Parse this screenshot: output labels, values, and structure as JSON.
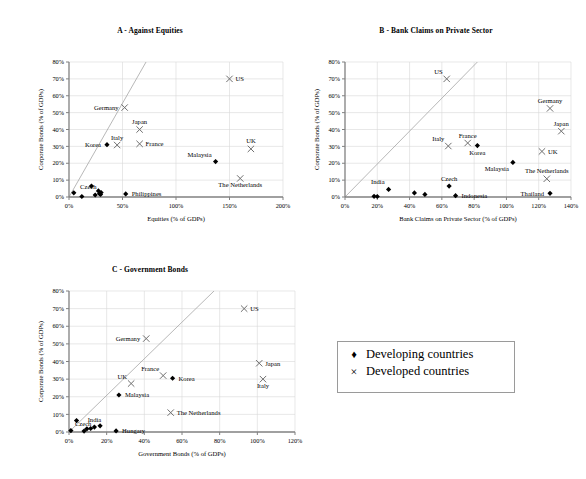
{
  "legend": {
    "items": [
      {
        "marker": "diamond",
        "marker_glyph": "♦",
        "label": "Developing countries"
      },
      {
        "marker": "cross",
        "marker_glyph": "×",
        "label": "Developed countries"
      }
    ]
  },
  "colors": {
    "marker": "#000000",
    "axis": "#808080",
    "gridline": "#d9d9d9",
    "refline": "#a6a6a6",
    "text": "#000000",
    "legend_border": "#9a9a9a"
  },
  "chart_data": [
    {
      "id": "panel-a",
      "type": "scatter",
      "title": "A - Against Equities",
      "xlabel": "Equities (% of GDPs)",
      "ylabel": "Corporate Bonds (% of GDPs)",
      "xlim": [
        0,
        200
      ],
      "ylim": [
        0,
        80
      ],
      "xticks": [
        0,
        50,
        100,
        150,
        200
      ],
      "yticks": [
        0,
        10,
        20,
        30,
        40,
        50,
        60,
        70,
        80
      ],
      "xticklabels": [
        "0%",
        "50%",
        "100%",
        "150%",
        "200%"
      ],
      "yticklabels": [
        "0%",
        "10%",
        "20%",
        "30%",
        "40%",
        "50%",
        "60%",
        "70%",
        "80%"
      ],
      "grid": true,
      "reference_line": {
        "from": [
          0,
          0
        ],
        "to": [
          72,
          82
        ],
        "style": "45-degree"
      },
      "series": [
        {
          "name": "Developing countries",
          "marker": "diamond",
          "points": [
            {
              "label": "",
              "x": 4.5,
              "y": 2.5,
              "label_pos": ""
            },
            {
              "label": "",
              "x": 12.0,
              "y": 0.3,
              "label_pos": ""
            },
            {
              "label": "",
              "x": 21.0,
              "y": 6.5,
              "label_pos": ""
            },
            {
              "label": "",
              "x": 24.5,
              "y": 1.2,
              "label_pos": ""
            },
            {
              "label": "",
              "x": 27.5,
              "y": 3.6,
              "label_pos": ""
            },
            {
              "label": "",
              "x": 28.5,
              "y": 2.0,
              "label_pos": ""
            },
            {
              "label": "",
              "x": 30.0,
              "y": 2.6,
              "label_pos": ""
            },
            {
              "label": "Czech",
              "x": 29.5,
              "y": 1.5,
              "label_pos": "above-left"
            },
            {
              "label": "Korea",
              "x": 35.5,
              "y": 31.0,
              "label_pos": "left"
            },
            {
              "label": "Philippines",
              "x": 53.0,
              "y": 1.8,
              "label_pos": "right"
            },
            {
              "label": "Malaysia",
              "x": 137.0,
              "y": 21.0,
              "label_pos": "above-left"
            }
          ]
        },
        {
          "name": "Developed countries",
          "marker": "cross",
          "points": [
            {
              "label": "Italy",
              "x": 45.0,
              "y": 30.8,
              "label_pos": "above"
            },
            {
              "label": "Germany",
              "x": 52.0,
              "y": 53.0,
              "label_pos": "left"
            },
            {
              "label": "Japan",
              "x": 66.0,
              "y": 40.0,
              "label_pos": "above"
            },
            {
              "label": "France",
              "x": 66.0,
              "y": 31.5,
              "label_pos": "right"
            },
            {
              "label": "US",
              "x": 150.0,
              "y": 70.0,
              "label_pos": "right"
            },
            {
              "label": "The Netherlands",
              "x": 160.0,
              "y": 11.0,
              "label_pos": "below"
            },
            {
              "label": "UK",
              "x": 170.0,
              "y": 28.5,
              "label_pos": "above"
            }
          ]
        }
      ]
    },
    {
      "id": "panel-b",
      "type": "scatter",
      "title": "B - Bank Claims on Private Sector",
      "xlabel": "Bank Claims on Private Sector (% of GDPs)",
      "ylabel": "Corporate Bonds (% of GDPs)",
      "xlim": [
        0,
        140
      ],
      "ylim": [
        0,
        80
      ],
      "xticks": [
        0,
        20,
        40,
        60,
        80,
        100,
        120,
        140
      ],
      "yticks": [
        0,
        10,
        20,
        30,
        40,
        50,
        60,
        70,
        80
      ],
      "xticklabels": [
        "0%",
        "20%",
        "40%",
        "60%",
        "80%",
        "100%",
        "120%",
        "140%"
      ],
      "yticklabels": [
        "0%",
        "10%",
        "20%",
        "30%",
        "40%",
        "50%",
        "60%",
        "70%",
        "80%"
      ],
      "grid": true,
      "reference_line": {
        "from": [
          0,
          0
        ],
        "to": [
          82,
          82
        ],
        "style": "45-degree"
      },
      "series": [
        {
          "name": "Developing countries",
          "marker": "diamond",
          "points": [
            {
              "label": "",
              "x": 18.0,
              "y": 0.4,
              "label_pos": ""
            },
            {
              "label": "",
              "x": 20.0,
              "y": 0.3,
              "label_pos": ""
            },
            {
              "label": "India",
              "x": 27.0,
              "y": 4.5,
              "label_pos": "above-left"
            },
            {
              "label": "",
              "x": 43.0,
              "y": 2.4,
              "label_pos": ""
            },
            {
              "label": "",
              "x": 49.5,
              "y": 1.5,
              "label_pos": ""
            },
            {
              "label": "Czech",
              "x": 64.5,
              "y": 6.5,
              "label_pos": "above"
            },
            {
              "label": "Indonesia",
              "x": 68.5,
              "y": 0.8,
              "label_pos": "right"
            },
            {
              "label": "Korea",
              "x": 82.0,
              "y": 30.5,
              "label_pos": "below"
            },
            {
              "label": "Malaysia",
              "x": 104.0,
              "y": 20.5,
              "label_pos": "below-left"
            },
            {
              "label": "Thailand",
              "x": 127.0,
              "y": 2.2,
              "label_pos": "left"
            }
          ]
        },
        {
          "name": "Developed countries",
          "marker": "cross",
          "points": [
            {
              "label": "US",
              "x": 63.0,
              "y": 70.0,
              "label_pos": "above-left"
            },
            {
              "label": "Italy",
              "x": 64.0,
              "y": 30.2,
              "label_pos": "above-left"
            },
            {
              "label": "France",
              "x": 76.0,
              "y": 32.0,
              "label_pos": "above"
            },
            {
              "label": "The Netherlands",
              "x": 125.0,
              "y": 10.8,
              "label_pos": "above"
            },
            {
              "label": "UK",
              "x": 122.0,
              "y": 27.0,
              "label_pos": "right"
            },
            {
              "label": "Germany",
              "x": 127.0,
              "y": 52.5,
              "label_pos": "above"
            },
            {
              "label": "Japan",
              "x": 134.0,
              "y": 39.0,
              "label_pos": "above"
            }
          ]
        }
      ]
    },
    {
      "id": "panel-c",
      "type": "scatter",
      "title": "C - Government Bonds",
      "xlabel": "Government Bonds (% of GDPs)",
      "ylabel": "Corporate Bonds (% of GDPs)",
      "xlim": [
        0,
        120
      ],
      "ylim": [
        0,
        80
      ],
      "xticks": [
        0,
        20,
        40,
        60,
        80,
        100,
        120
      ],
      "yticks": [
        0,
        10,
        20,
        30,
        40,
        50,
        60,
        70,
        80
      ],
      "xticklabels": [
        "0%",
        "20%",
        "40%",
        "60%",
        "80%",
        "100%",
        "120%"
      ],
      "yticklabels": [
        "0%",
        "10%",
        "20%",
        "30%",
        "40%",
        "50%",
        "60%",
        "70%",
        "80%"
      ],
      "grid": true,
      "reference_line": {
        "from": [
          0,
          0
        ],
        "to": [
          77,
          80
        ],
        "style": "45-degree"
      },
      "series": [
        {
          "name": "Developing countries",
          "marker": "diamond",
          "points": [
            {
              "label": "Czech",
              "x": 1.0,
              "y": 0.8,
              "label_pos": "above-right"
            },
            {
              "label": "",
              "x": 4.0,
              "y": 6.5,
              "label_pos": ""
            },
            {
              "label": "",
              "x": 8.0,
              "y": 0.5,
              "label_pos": ""
            },
            {
              "label": "",
              "x": 9.5,
              "y": 1.8,
              "label_pos": ""
            },
            {
              "label": "",
              "x": 11.5,
              "y": 2.0,
              "label_pos": ""
            },
            {
              "label": "India",
              "x": 13.5,
              "y": 2.8,
              "label_pos": "above"
            },
            {
              "label": "",
              "x": 16.5,
              "y": 3.5,
              "label_pos": ""
            },
            {
              "label": "Hungary",
              "x": 25.0,
              "y": 0.6,
              "label_pos": "right"
            },
            {
              "label": "Malaysia",
              "x": 26.5,
              "y": 21.0,
              "label_pos": "right"
            },
            {
              "label": "Korea",
              "x": 55.0,
              "y": 30.5,
              "label_pos": "right"
            }
          ]
        },
        {
          "name": "Developed countries",
          "marker": "cross",
          "points": [
            {
              "label": "UK",
              "x": 33.0,
              "y": 27.5,
              "label_pos": "above-left"
            },
            {
              "label": "Germany",
              "x": 41.0,
              "y": 53.0,
              "label_pos": "left"
            },
            {
              "label": "France",
              "x": 50.0,
              "y": 32.0,
              "label_pos": "above-left"
            },
            {
              "label": "The Netherlands",
              "x": 54.0,
              "y": 11.0,
              "label_pos": "right"
            },
            {
              "label": "US",
              "x": 93.0,
              "y": 70.0,
              "label_pos": "right"
            },
            {
              "label": "Japan",
              "x": 101.0,
              "y": 39.0,
              "label_pos": "right"
            },
            {
              "label": "Italy",
              "x": 103.0,
              "y": 30.0,
              "label_pos": "below"
            }
          ]
        }
      ]
    }
  ]
}
